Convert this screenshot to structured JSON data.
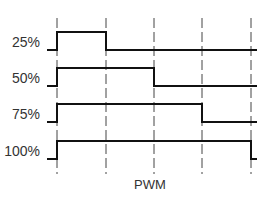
{
  "diagram": {
    "title": "PWM",
    "axis_label": "PWM",
    "period_markers_x": [
      57,
      106,
      154,
      202,
      251
    ],
    "waveforms": [
      {
        "label": "25%",
        "duty": 0.25,
        "high_y": 32,
        "low_y": 50,
        "fall_x": 106
      },
      {
        "label": "50%",
        "duty": 0.5,
        "high_y": 68,
        "low_y": 86,
        "fall_x": 154
      },
      {
        "label": "75%",
        "duty": 0.75,
        "high_y": 104,
        "low_y": 122,
        "fall_x": 202
      },
      {
        "label": "100%",
        "duty": 1.0,
        "high_y": 141,
        "low_y": 159,
        "fall_x": 251
      }
    ],
    "colors": {
      "signal": "#111111",
      "marker": "#444444",
      "text": "#333333",
      "background": "#ffffff"
    }
  }
}
